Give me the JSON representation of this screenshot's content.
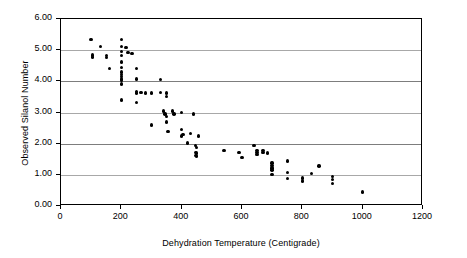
{
  "chart_data": {
    "type": "scatter",
    "title": "",
    "xlabel": "Dehydration Temperature (Centigrade)",
    "ylabel": "Observed Silanol Number",
    "xlim": [
      0,
      1200
    ],
    "ylim": [
      0,
      6
    ],
    "xticks": [
      0,
      200,
      400,
      600,
      800,
      1000,
      1200
    ],
    "xtick_labels": [
      "0",
      "200",
      "400",
      "600",
      "800",
      "1000",
      "1200"
    ],
    "yticks": [
      0,
      1,
      2,
      3,
      4,
      5,
      6
    ],
    "ytick_labels": [
      "0.00",
      "1.00",
      "2.00",
      "3.00",
      "4.00",
      "5.00",
      "6.00"
    ],
    "grid": "horizontal",
    "legend": null,
    "marker": "filled-circle",
    "marker_color": "#000000",
    "series": [
      {
        "name": "Observed silanol number",
        "points": [
          [
            100,
            5.35
          ],
          [
            105,
            4.85
          ],
          [
            105,
            4.78
          ],
          [
            130,
            5.12
          ],
          [
            150,
            4.82
          ],
          [
            150,
            4.76
          ],
          [
            160,
            4.42
          ],
          [
            200,
            5.35
          ],
          [
            200,
            5.12
          ],
          [
            200,
            4.95
          ],
          [
            200,
            4.83
          ],
          [
            200,
            4.62
          ],
          [
            200,
            4.45
          ],
          [
            200,
            4.3
          ],
          [
            200,
            4.22
          ],
          [
            200,
            4.15
          ],
          [
            200,
            4.08
          ],
          [
            200,
            4.02
          ],
          [
            200,
            3.92
          ],
          [
            200,
            3.4
          ],
          [
            215,
            5.08
          ],
          [
            222,
            4.93
          ],
          [
            235,
            4.9
          ],
          [
            250,
            4.42
          ],
          [
            250,
            4.08
          ],
          [
            250,
            3.68
          ],
          [
            250,
            3.62
          ],
          [
            250,
            3.32
          ],
          [
            265,
            3.65
          ],
          [
            280,
            3.62
          ],
          [
            300,
            3.62
          ],
          [
            300,
            2.6
          ],
          [
            330,
            4.05
          ],
          [
            330,
            3.65
          ],
          [
            340,
            3.05
          ],
          [
            345,
            2.95
          ],
          [
            350,
            3.62
          ],
          [
            350,
            3.52
          ],
          [
            350,
            2.88
          ],
          [
            350,
            2.7
          ],
          [
            355,
            2.4
          ],
          [
            370,
            3.05
          ],
          [
            375,
            2.95
          ],
          [
            400,
            3.0
          ],
          [
            400,
            2.45
          ],
          [
            400,
            2.25
          ],
          [
            405,
            2.3
          ],
          [
            420,
            2.02
          ],
          [
            430,
            2.32
          ],
          [
            440,
            2.95
          ],
          [
            445,
            1.95
          ],
          [
            445,
            1.72
          ],
          [
            445,
            1.62
          ],
          [
            450,
            1.88
          ],
          [
            450,
            1.7
          ],
          [
            450,
            1.6
          ],
          [
            455,
            2.25
          ],
          [
            540,
            1.78
          ],
          [
            590,
            1.72
          ],
          [
            600,
            1.55
          ],
          [
            640,
            1.95
          ],
          [
            650,
            1.78
          ],
          [
            650,
            1.72
          ],
          [
            650,
            1.65
          ],
          [
            670,
            1.78
          ],
          [
            670,
            1.72
          ],
          [
            685,
            1.7
          ],
          [
            700,
            1.38
          ],
          [
            700,
            1.3
          ],
          [
            700,
            1.22
          ],
          [
            700,
            1.15
          ],
          [
            700,
            1.02
          ],
          [
            750,
            1.45
          ],
          [
            750,
            1.08
          ],
          [
            750,
            0.88
          ],
          [
            800,
            0.9
          ],
          [
            800,
            0.8
          ],
          [
            830,
            1.05
          ],
          [
            855,
            1.28
          ],
          [
            900,
            0.95
          ],
          [
            900,
            0.85
          ],
          [
            900,
            0.72
          ],
          [
            1000,
            0.45
          ]
        ]
      }
    ]
  }
}
